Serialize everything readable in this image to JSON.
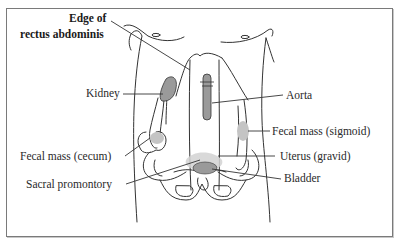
{
  "diagram": {
    "type": "anatomical-illustration",
    "colors": {
      "line": "#333333",
      "organ_dark": "#9a9a9a",
      "organ_light": "#c4c4c4",
      "frame": "#7a7a7a"
    },
    "labels": {
      "rectus_line1": "Edge of",
      "rectus_line2": "rectus abdominis",
      "kidney": "Kidney",
      "aorta": "Aorta",
      "fecal_sigmoid": "Fecal mass (sigmoid)",
      "fecal_cecum": "Fecal mass (cecum)",
      "uterus": "Uterus (gravid)",
      "sacral": "Sacral promontory",
      "bladder": "Bladder"
    }
  }
}
